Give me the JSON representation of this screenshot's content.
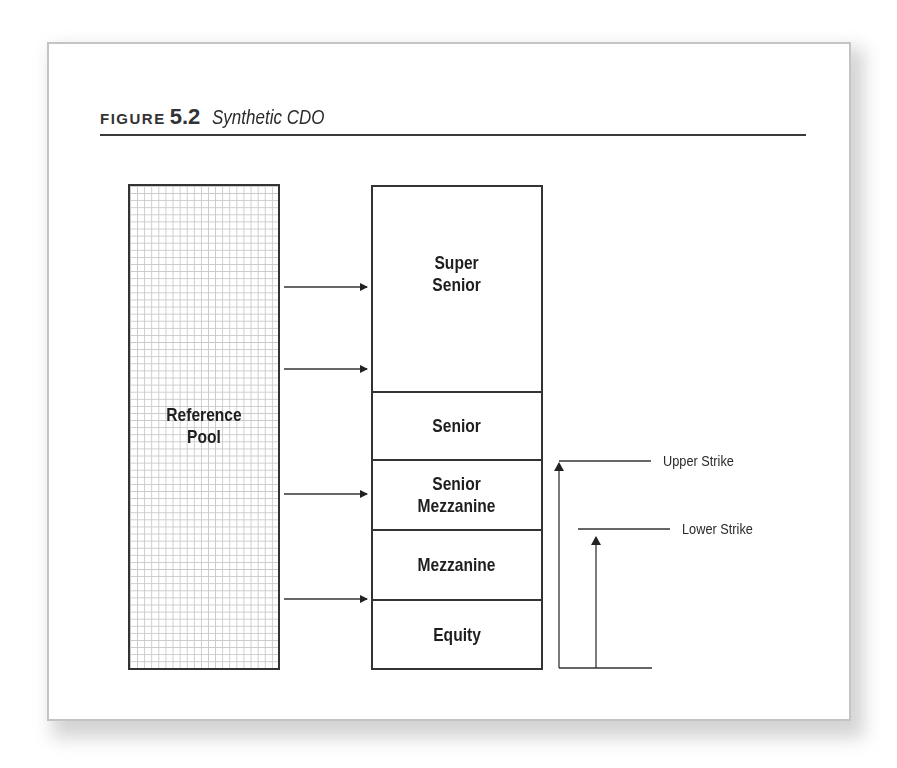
{
  "figure": {
    "label_word": "FIGURE",
    "label_number": "5.2",
    "title": "Synthetic CDO"
  },
  "reference_pool": {
    "label": "Reference\nPool",
    "line1": "Reference",
    "line2": "Pool"
  },
  "tranches": [
    {
      "name": "super-senior",
      "label": "Super\nSenior"
    },
    {
      "name": "senior",
      "label": "Senior"
    },
    {
      "name": "senior-mezzanine",
      "label": "Senior\nMezzanine"
    },
    {
      "name": "mezzanine",
      "label": "Mezzanine"
    },
    {
      "name": "equity",
      "label": "Equity"
    }
  ],
  "strikes": {
    "upper": "Upper Strike",
    "lower": "Lower Strike"
  },
  "colors": {
    "line": "#333333",
    "grid": "#c9c9c9",
    "card_border": "#c4c4c4"
  }
}
